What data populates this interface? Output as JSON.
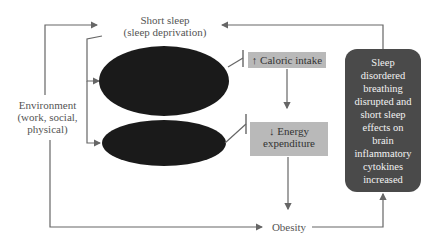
{
  "diagram": {
    "nodes": {
      "short_sleep": {
        "line1": "Short sleep",
        "line2": "(sleep deprivation)"
      },
      "environment": {
        "line1": "Environment",
        "line2": "(work, social,",
        "line3": "physical)"
      },
      "caloric_intake": {
        "arrow": "↑",
        "label": "Caloric intake"
      },
      "energy_expenditure": {
        "arrow": "↓",
        "line1": "Energy",
        "line2": "expenditure"
      },
      "obesity": {
        "label": "Obesity"
      },
      "sleep_disordered_breathing": {
        "lines": [
          "Sleep",
          "disordered",
          "breathing",
          "disrupted and",
          "short sleep",
          "effects on",
          "brain",
          "inflammatory",
          "cytokines",
          "increased"
        ]
      }
    },
    "colors": {
      "ellipse_fill": "#1a1a1a",
      "grey_box": "#b9b9b9",
      "dark_box": "#4a4a4a",
      "line": "#666666"
    }
  }
}
